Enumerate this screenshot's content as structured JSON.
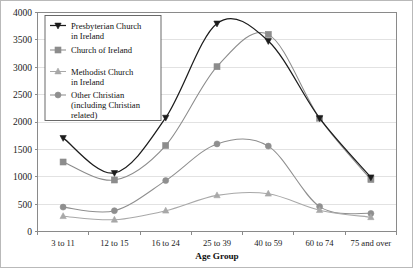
{
  "chart_data": {
    "type": "line",
    "title": "",
    "xlabel": "Age Group",
    "ylabel": "",
    "categories": [
      "3 to 11",
      "12 to 15",
      "16 to 24",
      "25 to 39",
      "40 to 59",
      "60 to 74",
      "75 and over"
    ],
    "ylim": [
      0,
      4000
    ],
    "ytick_step": 500,
    "yticks": [
      0,
      500,
      1000,
      1500,
      2000,
      2500,
      3000,
      3500,
      4000
    ],
    "ytick_labels": [
      "0",
      "500",
      "1000",
      "1500",
      "2000",
      "2500",
      "3000",
      "3500",
      "4000"
    ],
    "grid": true,
    "grid_axis": "y",
    "legend_position": "top-left",
    "series": [
      {
        "name": "Presbyterian Church in Ireland",
        "marker": "triangle-down",
        "color": "#1c1c1c",
        "values": [
          1710,
          1070,
          2080,
          3800,
          3480,
          2070,
          990
        ]
      },
      {
        "name": "Church of Ireland",
        "marker": "square",
        "color": "#8c8c8c",
        "values": [
          1270,
          940,
          1570,
          3010,
          3600,
          2070,
          950
        ]
      },
      {
        "name": "Methodist Church in Ireland",
        "marker": "triangle-up",
        "color": "#a8a8a8",
        "values": [
          280,
          215,
          380,
          660,
          690,
          390,
          260
        ]
      },
      {
        "name": "Other Christian (including Christian related)",
        "marker": "circle",
        "color": "#8f8f8f",
        "values": [
          445,
          380,
          930,
          1600,
          1560,
          455,
          330
        ]
      }
    ]
  },
  "legend": {
    "entries": [
      {
        "label_line1": "Presbyterian Church",
        "label_line2": "in Ireland"
      },
      {
        "label_line1": "Church of Ireland",
        "label_line2": ""
      },
      {
        "label_line1": "Methodist Church",
        "label_line2": "in Ireland"
      },
      {
        "label_line1": "Other Christian",
        "label_line2": "(including Christian",
        "label_line3": "related)"
      }
    ]
  },
  "colors": {
    "presbyterian": "#1c1c1c",
    "church_of_ireland": "#8c8c8c",
    "methodist": "#a8a8a8",
    "other_christian": "#8f8f8f",
    "gridline": "#e2e2e2",
    "axis": "#8a8a8a",
    "background": "#ffffff"
  }
}
